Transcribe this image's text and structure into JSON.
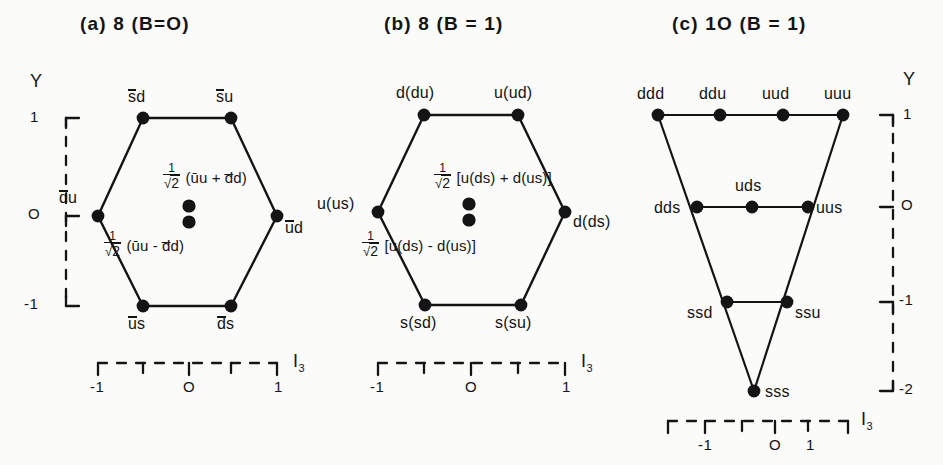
{
  "figure": {
    "kind": "su3-weight-diagrams",
    "background": "#fbfbf9",
    "ink": "#141414"
  },
  "panels": [
    {
      "id": "a",
      "title": "(a) 8 (B=O)",
      "shape": "hexagon",
      "multiplicity": "8",
      "baryon_number": "B=O",
      "axes": {
        "y_label": "Y",
        "y_ticks": [
          "1",
          "O",
          "-1"
        ],
        "x_label": "I",
        "x_label_sub": "3",
        "x_ticks": [
          "-1",
          "O",
          "1"
        ]
      },
      "states": [
        {
          "name": "s-bar d",
          "text": "sd",
          "overline": "s",
          "x": -0.5,
          "y": 1,
          "pos": "top"
        },
        {
          "name": "s-bar u",
          "text": "su",
          "overline": "s",
          "x": 0.5,
          "y": 1,
          "pos": "top"
        },
        {
          "name": "d-bar u",
          "text": "du",
          "overline": "d",
          "x": -1,
          "y": 0,
          "pos": "left"
        },
        {
          "name": "u-bar d",
          "text": "ud",
          "overline": "u",
          "x": 1,
          "y": 0,
          "pos": "right"
        },
        {
          "name": "u-bar s",
          "text": "us",
          "overline": "u",
          "x": -0.5,
          "y": -1,
          "pos": "bottom"
        },
        {
          "name": "d-bar s",
          "text": "ds",
          "overline": "d",
          "x": 0.5,
          "y": -1,
          "pos": "bottom"
        }
      ],
      "center_states": [
        {
          "name": "symmetric-center",
          "frac_num": "1",
          "frac_den_sym": "√",
          "frac_den_arg": "2",
          "body": "(ūu + d̅d)",
          "placement": "above"
        },
        {
          "name": "antisymmetric-center",
          "frac_num": "1",
          "frac_den_sym": "√",
          "frac_den_arg": "2",
          "body": "(ūu - d̅d)",
          "placement": "below"
        }
      ],
      "center_dots": 2
    },
    {
      "id": "b",
      "title": "(b) 8 (B = 1)",
      "shape": "hexagon",
      "multiplicity": "8",
      "baryon_number": "B = 1",
      "axes": {
        "y_label": "",
        "y_ticks": [],
        "x_label": "I",
        "x_label_sub": "3",
        "x_ticks": [
          "-1",
          "O",
          "1"
        ]
      },
      "states": [
        {
          "name": "d-du",
          "text": "d(du)",
          "x": -0.5,
          "y": 1,
          "pos": "top"
        },
        {
          "name": "u-ud",
          "text": "u(ud)",
          "x": 0.5,
          "y": 1,
          "pos": "top"
        },
        {
          "name": "u-us",
          "text": "u(us)",
          "x": -1,
          "y": 0,
          "pos": "left"
        },
        {
          "name": "d-ds",
          "text": "d(ds)",
          "x": 1,
          "y": 0,
          "pos": "right"
        },
        {
          "name": "s-sd",
          "text": "s(sd)",
          "x": -0.5,
          "y": -1,
          "pos": "bottom"
        },
        {
          "name": "s-su",
          "text": "s(su)",
          "x": 0.5,
          "y": -1,
          "pos": "bottom"
        }
      ],
      "center_states": [
        {
          "name": "symmetric-center",
          "frac_num": "1",
          "frac_den_sym": "√",
          "frac_den_arg": "2",
          "body": "[u(ds) + d(us)]",
          "placement": "above"
        },
        {
          "name": "antisymmetric-center",
          "frac_num": "1",
          "frac_den_sym": "√",
          "frac_den_arg": "2",
          "body": "[u(ds) - d(us)]",
          "placement": "below"
        }
      ],
      "center_dots": 2
    },
    {
      "id": "c",
      "title": "(c) 1O (B = 1)",
      "shape": "triangle",
      "multiplicity": "1O",
      "baryon_number": "B = 1",
      "axes": {
        "y_label": "Y",
        "y_ticks": [
          "1",
          "O",
          "-1",
          "-2"
        ],
        "x_label": "I",
        "x_label_sub": "3",
        "x_ticks": [
          "-1",
          "O",
          "1"
        ]
      },
      "states": [
        {
          "name": "ddd",
          "text": "ddd",
          "x": -1.5,
          "y": 1,
          "pos": "above"
        },
        {
          "name": "ddu",
          "text": "ddu",
          "x": -0.5,
          "y": 1,
          "pos": "above"
        },
        {
          "name": "uud",
          "text": "uud",
          "x": 0.5,
          "y": 1,
          "pos": "above"
        },
        {
          "name": "uuu",
          "text": "uuu",
          "x": 1.5,
          "y": 1,
          "pos": "above"
        },
        {
          "name": "dds",
          "text": "dds",
          "x": -1,
          "y": 0,
          "pos": "left"
        },
        {
          "name": "uds",
          "text": "uds",
          "x": 0,
          "y": 0,
          "pos": "above"
        },
        {
          "name": "uus",
          "text": "uus",
          "x": 1,
          "y": 0,
          "pos": "right"
        },
        {
          "name": "ssd",
          "text": "ssd",
          "x": -0.5,
          "y": -1,
          "pos": "below-left"
        },
        {
          "name": "ssu",
          "text": "ssu",
          "x": 0.5,
          "y": -1,
          "pos": "below-right"
        },
        {
          "name": "sss",
          "text": "sss",
          "x": 0,
          "y": -2,
          "pos": "right"
        }
      ],
      "center_dots": 0
    }
  ]
}
